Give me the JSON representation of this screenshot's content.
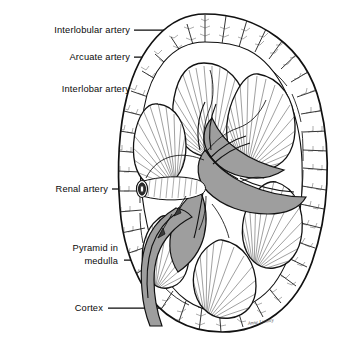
{
  "figure": {
    "background_color": "#ffffff",
    "ink_color": "#111111",
    "sinus_fill_color": "#9e9e9e",
    "signature": "Anne Lumley"
  },
  "labels": [
    {
      "id": "interlobular-artery",
      "text": "Interlobular artery",
      "x": 130,
      "y": 33,
      "line_x1": 134,
      "line_x2": 196,
      "line_y": 30
    },
    {
      "id": "arcuate-artery",
      "text": "Arcuate artery",
      "x": 130,
      "y": 60,
      "line_x1": 134,
      "line_x2": 205,
      "line_y": 57
    },
    {
      "id": "interlobar-artery",
      "text": "Interlobar artery",
      "x": 130,
      "y": 92,
      "line_x1": 136,
      "line_x2": 208,
      "line_y": 89
    },
    {
      "id": "renal-artery",
      "text": "Renal artery",
      "x": 108,
      "y": 192,
      "line_x1": 112,
      "line_x2": 136,
      "line_y": 189
    },
    {
      "id": "pyramid-in-medulla-line1",
      "text": "Pyramid in",
      "x": 118,
      "y": 251,
      "line_x1": 0,
      "line_x2": 0,
      "line_y": 0
    },
    {
      "id": "pyramid-in-medulla-line2",
      "text": "medulla",
      "x": 118,
      "y": 263,
      "line_x1": 124,
      "line_x2": 244,
      "line_y": 260
    },
    {
      "id": "cortex",
      "text": "Cortex",
      "x": 103,
      "y": 311,
      "line_x1": 108,
      "line_x2": 258,
      "line_y": 308
    }
  ],
  "structures": [
    {
      "id": "renal-capsule",
      "name": "Renal capsule outline"
    },
    {
      "id": "cortex-region",
      "name": "Cortex"
    },
    {
      "id": "medulla-region",
      "name": "Medulla"
    },
    {
      "id": "renal-pyramid",
      "name": "Renal pyramid"
    },
    {
      "id": "renal-sinus",
      "name": "Renal sinus and pelvis"
    },
    {
      "id": "renal-artery-vessel",
      "name": "Renal artery"
    },
    {
      "id": "ureter",
      "name": "Ureter"
    },
    {
      "id": "flow-arrow",
      "name": "Urine flow arrow"
    }
  ]
}
